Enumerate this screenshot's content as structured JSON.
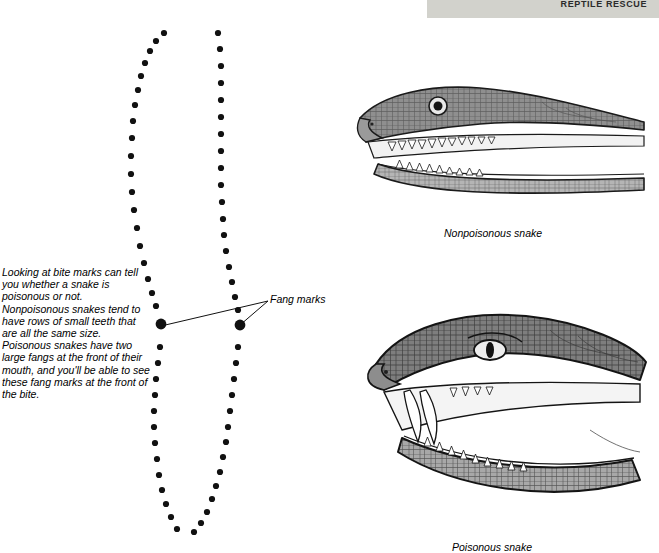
{
  "header": {
    "tab_label": "REPTILE RESCUE",
    "tab_color": "#d2d2cc"
  },
  "caption": {
    "text": "Looking at bite marks can tell you whether a snake is poisonous or not. Nonpoisonous snakes tend to have rows of small teeth that are all the same size. Poisonous snakes have two large fangs at the front of their mouth, and you'll be able to see these fang marks at the front of the bite."
  },
  "labels": {
    "fang_marks": "Fang marks",
    "nonpoisonous": "Nonpoisonous snake",
    "poisonous": "Poisonous snake"
  },
  "figures": {
    "bite_diagram_name": "bite-mark-diagram",
    "snake_head_nonpoisonous": "nonpoisonous-snake-head-illustration",
    "snake_head_poisonous": "poisonous-snake-head-illustration"
  },
  "colors": {
    "ink": "#1a1a1a",
    "mid_gray": "#8c8c8c",
    "light_gray": "#c9c9c9",
    "dark_gray": "#4d4d4d",
    "page_bg": "#ffffff"
  }
}
